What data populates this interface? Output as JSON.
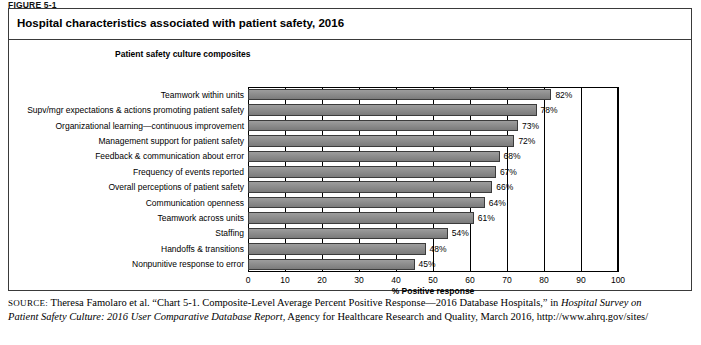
{
  "figure_label": "FIGURE 5-1",
  "chart_title": "Hospital characteristics associated with patient safety, 2016",
  "composites_header": "Patient safety culture composites",
  "source": {
    "label": "SOURCE:",
    "line1_a": " Theresa Famolaro et al. “Chart 5-1. Composite-Level Average Percent Positive Response—2016 Database Hospitals,” in ",
    "line1_i": "Hospital Survey on",
    "line2_i": "Patient Safety Culture: 2016 User Comparative Database Report",
    "line2_a": ", Agency for Healthcare Research and Quality, March 2016, http://www.ahrq.gov/sites/"
  },
  "chart_data": {
    "type": "bar",
    "orientation": "horizontal",
    "title": "Hospital characteristics associated with patient safety, 2016",
    "xlabel": "% Positive response",
    "ylabel": "Patient safety culture composites",
    "xlim": [
      0,
      100
    ],
    "xticks": [
      "0",
      "10",
      "20",
      "30",
      "40",
      "50",
      "60",
      "70",
      "80",
      "90",
      "100"
    ],
    "grid": true,
    "legend": "none",
    "bar_color": "#8f8f8f",
    "categories": [
      "Teamwork within units",
      "Supv/mgr expectations & actions promoting patient safety",
      "Organizational learning—continuous improvement",
      "Management support for patient safety",
      "Feedback & communication about error",
      "Frequency of events reported",
      "Overall perceptions of patient safety",
      "Communication openness",
      "Teamwork across units",
      "Staffing",
      "Handoffs & transitions",
      "Nonpunitive response to error"
    ],
    "values": [
      82,
      78,
      73,
      72,
      68,
      67,
      66,
      64,
      61,
      54,
      48,
      45
    ],
    "value_labels": [
      "82%",
      "78%",
      "73%",
      "72%",
      "68%",
      "67%",
      "66%",
      "64%",
      "61%",
      "54%",
      "48%",
      "45%"
    ]
  }
}
